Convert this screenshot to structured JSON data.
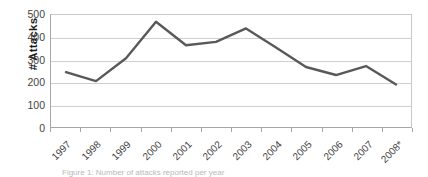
{
  "chart_data": {
    "type": "line",
    "title": "",
    "xlabel": "",
    "ylabel": "# Attacks",
    "categories": [
      "1997",
      "1998",
      "1999",
      "2000",
      "2001",
      "2002",
      "2003",
      "2004",
      "2005",
      "2006",
      "2007",
      "2008*"
    ],
    "values": [
      245,
      205,
      307,
      470,
      365,
      380,
      440,
      355,
      268,
      232,
      272,
      190
    ],
    "series": [
      {
        "name": "# Attacks",
        "values": [
          245,
          205,
          307,
          470,
          365,
          380,
          440,
          355,
          268,
          232,
          272,
          190
        ]
      }
    ],
    "ylim": [
      0,
      500
    ],
    "yticks": [
      0,
      100,
      200,
      300,
      400,
      500
    ],
    "ytick_labels": [
      "0",
      "100",
      "200",
      "300",
      "400",
      "500"
    ],
    "grid": "horizontal",
    "legend": "none",
    "line_color": "#595959",
    "gridline_color": "#cfcfcf",
    "axis_color": "#a6a6a6",
    "background": "#ffffff"
  },
  "axis": {
    "y_title": "# Attacks"
  },
  "caption": {
    "text": "Figure 1: Number of attacks reported per year"
  }
}
